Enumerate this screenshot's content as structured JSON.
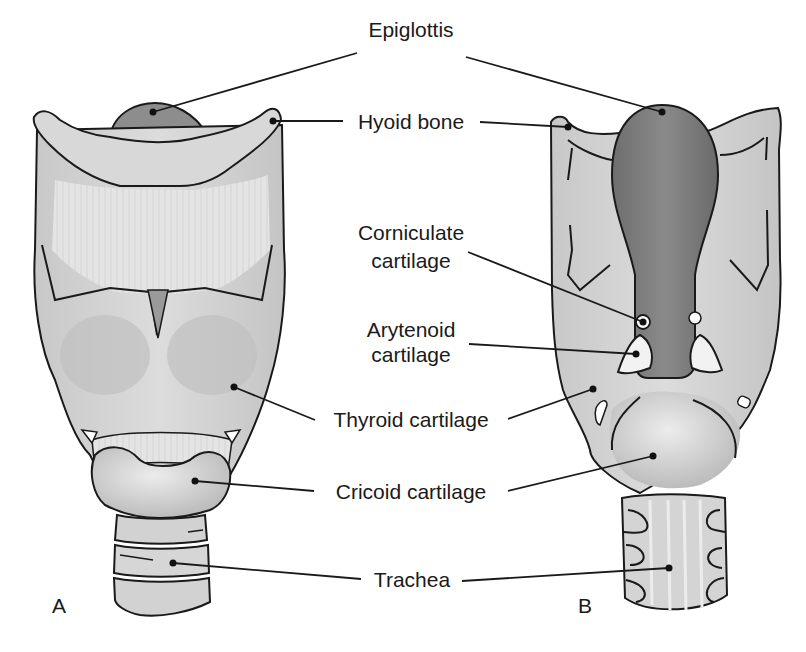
{
  "figure": {
    "panels": [
      {
        "id": "A",
        "label": "A",
        "view": "anterior"
      },
      {
        "id": "B",
        "label": "B",
        "view": "posterior"
      }
    ],
    "labels": {
      "epiglottis": "Epiglottis",
      "hyoid_bone": "Hyoid bone",
      "corniculate_line1": "Corniculate",
      "corniculate_line2": "cartilage",
      "arytenoid_line1": "Arytenoid",
      "arytenoid_line2": "cartilage",
      "thyroid_cartilage": "Thyroid cartilage",
      "cricoid_cartilage": "Cricoid cartilage",
      "trachea": "Trachea"
    },
    "colors": {
      "outline": "#1a1a1a",
      "cartilage_light": "#d9d9d9",
      "cartilage_mid": "#bdbdbd",
      "epiglottis": "#7f7f7f",
      "membrane": "#e6e6e6",
      "background": "#ffffff"
    }
  }
}
